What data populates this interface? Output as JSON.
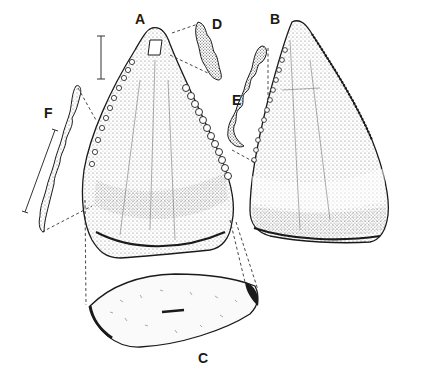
{
  "figure": {
    "panels": [
      {
        "id": "A",
        "label": "A",
        "view": "tooth crown, labial view"
      },
      {
        "id": "B",
        "label": "B",
        "view": "tooth crown, lingual view"
      },
      {
        "id": "C",
        "label": "C",
        "view": "basal cross-section"
      },
      {
        "id": "D",
        "label": "D",
        "view": "apical serration detail"
      },
      {
        "id": "E",
        "label": "E",
        "view": "distal carina serration detail"
      },
      {
        "id": "F",
        "label": "F",
        "view": "mesial carina serration detail"
      }
    ],
    "scale_bars": [
      {
        "id": "scale-bar-A",
        "orientation": "vertical"
      },
      {
        "id": "scale-bar-F",
        "orientation": "diagonal"
      }
    ],
    "colors": {
      "ink": "#1a1a1a",
      "stipple": "#6b6b6b",
      "background": "#ffffff"
    }
  }
}
